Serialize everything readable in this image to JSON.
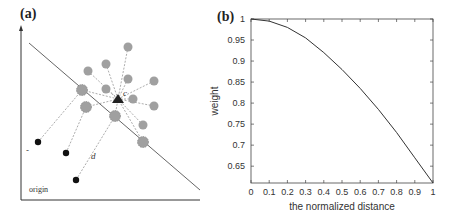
{
  "figure": {
    "panel_a": {
      "label": "(a)",
      "origin_label": "origin",
      "distance_label": "d",
      "center_label": "c",
      "minus_label": "-"
    },
    "panel_b": {
      "label": "(b)"
    }
  },
  "chart_data": [
    {
      "type": "scatter",
      "panel": "(a)",
      "title": "",
      "description": "Schematic: gray points (positive samples) connected by dashed lines to a central black triangle c; black points (negative samples) connected by dashed lines; a diagonal separating line; axes from origin.",
      "annotations": [
        "origin",
        "d",
        "c",
        "-"
      ],
      "points": {
        "center_triangle": {
          "x": 118,
          "y": 99
        },
        "gray_points": [
          {
            "x": 128,
            "y": 47
          },
          {
            "x": 106,
            "y": 64
          },
          {
            "x": 88,
            "y": 71
          },
          {
            "x": 128,
            "y": 79
          },
          {
            "x": 154,
            "y": 81
          },
          {
            "x": 106,
            "y": 89
          },
          {
            "x": 82,
            "y": 90
          },
          {
            "x": 133,
            "y": 99
          },
          {
            "x": 154,
            "y": 106
          },
          {
            "x": 86,
            "y": 107
          },
          {
            "x": 115,
            "y": 116
          },
          {
            "x": 143,
            "y": 125
          },
          {
            "x": 143,
            "y": 142
          }
        ],
        "black_points": [
          {
            "x": 38,
            "y": 142
          },
          {
            "x": 66,
            "y": 153
          },
          {
            "x": 76,
            "y": 180
          }
        ]
      },
      "separating_line": {
        "x1": 29,
        "y1": 43,
        "x2": 200,
        "y2": 190
      }
    },
    {
      "type": "line",
      "panel": "(b)",
      "title": "",
      "xlabel": "the normalized distance",
      "ylabel": "weight",
      "x": [
        0,
        0.1,
        0.2,
        0.3,
        0.4,
        0.5,
        0.6,
        0.7,
        0.8,
        0.9,
        1.0
      ],
      "series": [
        {
          "name": "weight",
          "values": [
            1.0,
            0.995,
            0.98,
            0.955,
            0.92,
            0.88,
            0.835,
            0.785,
            0.73,
            0.67,
            0.61
          ]
        }
      ],
      "xticks": [
        "0",
        "0.1",
        "0.2",
        "0.3",
        "0.4",
        "0.5",
        "0.6",
        "0.7",
        "0.8",
        "0.9",
        "1"
      ],
      "yticks": [
        "0.65",
        "0.7",
        "0.75",
        "0.8",
        "0.85",
        "0.9",
        "0.95",
        "1"
      ],
      "xlim": [
        0,
        1
      ],
      "ylim": [
        0.61,
        1.0
      ],
      "grid": false,
      "legend": null
    }
  ]
}
